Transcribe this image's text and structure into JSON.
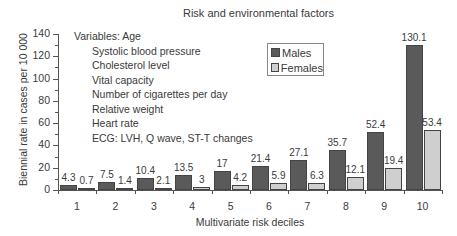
{
  "chart_data": {
    "type": "bar",
    "title": "Risk and environmental factors",
    "xlabel": "Multivariate risk deciles",
    "ylabel": "Biennial rate in cases per 10 000",
    "ylim": [
      0,
      140
    ],
    "yticks": [
      0,
      20,
      40,
      60,
      80,
      100,
      120,
      140
    ],
    "categories": [
      "1",
      "2",
      "3",
      "4",
      "5",
      "6",
      "7",
      "8",
      "9",
      "10"
    ],
    "series": [
      {
        "name": "Males",
        "color": "#5a5a5a",
        "values": [
          4.3,
          7.5,
          10.4,
          13.5,
          17,
          21.4,
          27.1,
          35.7,
          52.4,
          130.1
        ]
      },
      {
        "name": "Females",
        "color": "#cfcfcf",
        "values": [
          0.7,
          1.4,
          2.1,
          3,
          4.2,
          5.9,
          6.3,
          12.1,
          19.4,
          53.4
        ]
      }
    ],
    "value_labels": {
      "Males": [
        "4.3",
        "7.5",
        "10.4",
        "13.5",
        "17",
        "21.4",
        "27.1",
        "35.7",
        "52.4",
        "130.1"
      ],
      "Females": [
        "0.7",
        "1.4",
        "2.1",
        "3",
        "4.2",
        "5.9",
        "6.3",
        "12.1",
        "19.4",
        "53.4"
      ]
    },
    "legend": {
      "position": "upper-right-inside",
      "entries": [
        "Males",
        "Females"
      ]
    },
    "grid": false,
    "annotation": {
      "heading": "Variables: Age",
      "items": [
        "Systolic blood pressure",
        "Cholesterol level",
        "Vital capacity",
        "Number of cigarettes per day",
        "Relative weight",
        "Heart rate",
        "ECG: LVH, Q wave, ST-T changes"
      ]
    }
  }
}
